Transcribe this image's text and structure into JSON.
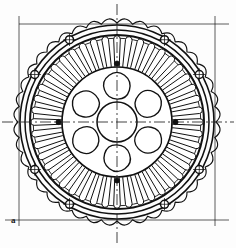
{
  "figure": {
    "caption_label": "a",
    "view": "front elevation / section",
    "line_style": "mechanical drawing, black on white"
  },
  "colors": {
    "stroke": "#111111",
    "background": "#ffffff",
    "centerline": "#222222",
    "fill": "#ffffff"
  },
  "geometry": {
    "center_x": 117,
    "center_y": 122,
    "outer_fin_tip_radius": 108,
    "outer_fin_root_radius": 99,
    "housing_outer_radius": 97,
    "housing_inner_radius": 92,
    "bolt_circle_radius": 95,
    "stator_back_iron_radius": 87,
    "slot_outer_radius": 83,
    "slot_inner_radius": 56,
    "rotor_outer_radius": 55,
    "rotor_bore_radius": 20,
    "pentagon_ring_radius": 36
  },
  "features": {
    "cooling_fins": {
      "name": "outer-scalloped-cooling-fins",
      "count": 40,
      "description": "serrated sawtooth outer profile"
    },
    "stator_slots": {
      "name": "stator-slot-ring",
      "count": 44,
      "description": "rounded teardrop slots opening inward"
    },
    "bolt_holes": {
      "name": "mounting-bolt-holes",
      "count": 8,
      "radius": 4,
      "angles_deg": [
        30,
        60,
        120,
        150,
        210,
        240,
        300,
        330
      ],
      "description": "circles with crosshair centre marks on bolt circle"
    },
    "rotor_pockets": {
      "name": "rotor-flux-barrier-pockets",
      "count": 6,
      "description": "rounded pentagon cutouts around central bore"
    },
    "center_bore": {
      "name": "rotor-shaft-bore",
      "description": "central circle at shaft axis"
    },
    "centerlines": {
      "name": "axis-centerlines",
      "style": "dash-dot",
      "axes": [
        "vertical",
        "horizontal"
      ]
    },
    "tangent_lines": {
      "name": "tangent-extension-lines",
      "description": "straight construction lines tangent to housing at top, bottom, left and right"
    }
  }
}
